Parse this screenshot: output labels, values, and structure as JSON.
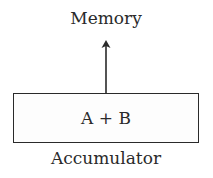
{
  "diagram": {
    "top_label": "Memory",
    "box_text": "A + B",
    "bottom_label": "Accumulator",
    "arrow_direction": "up",
    "colors": {
      "stroke": "#2a2a2a",
      "background": "#ffffff"
    }
  }
}
